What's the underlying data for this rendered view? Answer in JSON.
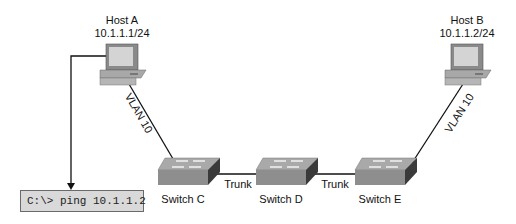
{
  "hosts": [
    {
      "name": "Host A",
      "ip": "10.1.1.1/24"
    },
    {
      "name": "Host B",
      "ip": "10.1.1.2/24"
    }
  ],
  "switches": [
    {
      "name": "Switch C"
    },
    {
      "name": "Switch D"
    },
    {
      "name": "Switch E"
    }
  ],
  "links": {
    "host_a_to_switch_c": "VLAN 10",
    "switch_c_to_switch_d": "Trunk",
    "switch_d_to_switch_e": "Trunk",
    "switch_e_to_host_b": "VLAN 10"
  },
  "command": "C:\\> ping 10.1.1.2"
}
